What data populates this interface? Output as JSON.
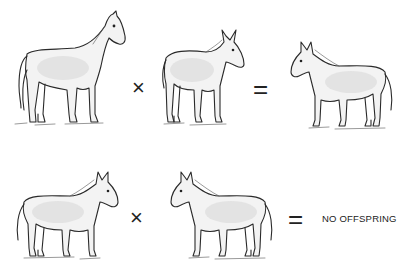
{
  "diagram": {
    "rows": [
      {
        "parent_1": {
          "animal": "horse",
          "facing": "right"
        },
        "operator_1": "×",
        "parent_2": {
          "animal": "donkey",
          "facing": "right"
        },
        "operator_2": "=",
        "result": {
          "animal": "mule",
          "facing": "left"
        }
      },
      {
        "parent_1": {
          "animal": "mule",
          "facing": "right"
        },
        "operator_1": "×",
        "parent_2": {
          "animal": "mule",
          "facing": "left"
        },
        "operator_2": "=",
        "result": {
          "text": "NO OFFSPRING"
        }
      }
    ]
  }
}
